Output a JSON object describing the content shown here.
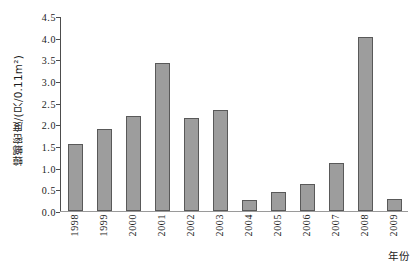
{
  "chart_data": {
    "type": "bar",
    "title": "",
    "subtitle": "",
    "xlabel": "年份",
    "ylabel": "蟑螂密度/(只/0.11m²)",
    "categories": [
      "1998",
      "1999",
      "2000",
      "2001",
      "2002",
      "2003",
      "2004",
      "2005",
      "2006",
      "2007",
      "2008",
      "2009"
    ],
    "values": [
      1.56,
      1.91,
      2.21,
      3.43,
      2.16,
      2.34,
      0.25,
      0.43,
      0.63,
      1.11,
      4.03,
      0.28
    ],
    "series": [
      {
        "name": "蟑螂密度",
        "values": [
          1.56,
          1.91,
          2.21,
          3.43,
          2.16,
          2.34,
          0.25,
          0.43,
          0.63,
          1.11,
          4.03,
          0.28
        ]
      }
    ],
    "ylim": [
      0.0,
      4.5
    ],
    "ytick_labels": [
      "0.0",
      "0.5",
      "1.0",
      "1.5",
      "2.0",
      "2.5",
      "3.0",
      "3.5",
      "4.0",
      "4.5"
    ],
    "ytick_values": [
      0.0,
      0.5,
      1.0,
      1.5,
      2.0,
      2.5,
      3.0,
      3.5,
      4.0,
      4.5
    ],
    "grid": false,
    "legend": false,
    "legend_position": "none",
    "bar_fill_color": "#9d9d9d",
    "bar_border_color": "#595959",
    "axis_color": "#4d4d4d",
    "background_color": "#ffffff",
    "xtick_rotation": 90
  }
}
